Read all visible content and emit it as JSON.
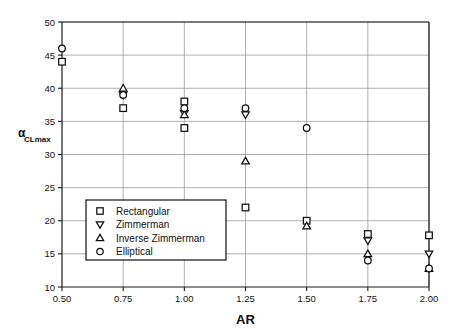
{
  "chart_data": {
    "type": "scatter",
    "title": "",
    "xlabel": "AR",
    "ylabel": "αCLmax",
    "ylabel_main": "α",
    "ylabel_sub": "CLmax",
    "xlim": [
      0.5,
      2.0
    ],
    "ylim": [
      10,
      50
    ],
    "xticks": [
      "0.50",
      "0.75",
      "1.00",
      "1.25",
      "1.50",
      "1.75",
      "2.00"
    ],
    "xtick_values": [
      0.5,
      0.75,
      1.0,
      1.25,
      1.5,
      1.75,
      2.0
    ],
    "yticks": [
      "10",
      "15",
      "20",
      "25",
      "30",
      "35",
      "40",
      "45",
      "50"
    ],
    "ytick_values": [
      10,
      15,
      20,
      25,
      30,
      35,
      40,
      45,
      50
    ],
    "grid": "horizontal-and-vertical",
    "legend_position": "lower-left-inside",
    "series": [
      {
        "name": "Rectangular",
        "marker": "square",
        "x": [
          0.5,
          0.75,
          1.0,
          1.25,
          1.5,
          1.75,
          2.0
        ],
        "values": [
          44.0,
          37.0,
          38.0,
          22.0,
          20.0,
          18.0,
          17.8
        ]
      },
      {
        "name": "Zimmerman",
        "marker": "triangle-down",
        "x": [
          0.75,
          1.0,
          1.25,
          1.75,
          2.0
        ],
        "values": [
          39.0,
          36.2,
          36.0,
          17.0,
          15.0
        ]
      },
      {
        "name": "Inverse Zimmerman",
        "marker": "triangle-up",
        "x": [
          0.75,
          1.0,
          1.25,
          1.5,
          1.75,
          2.0
        ],
        "values": [
          40.0,
          36.0,
          29.0,
          19.2,
          15.0,
          12.8
        ]
      },
      {
        "name": "Elliptical",
        "marker": "circle",
        "x": [
          0.5,
          0.75,
          1.0,
          1.25,
          1.5,
          1.75,
          2.0
        ],
        "values": [
          46.0,
          39.0,
          37.0,
          37.0,
          34.0,
          14.0,
          12.8
        ]
      },
      {
        "name": "Rectangular-extra",
        "marker": "square",
        "x": [
          1.0
        ],
        "values": [
          34.0
        ]
      }
    ],
    "legend": [
      {
        "label": "Rectangular",
        "marker": "square"
      },
      {
        "label": "Zimmerman",
        "marker": "triangle-down"
      },
      {
        "label": "Inverse Zimmerman",
        "marker": "triangle-up"
      },
      {
        "label": "Elliptical",
        "marker": "circle"
      }
    ],
    "colors": {
      "marker_stroke": "#101010",
      "marker_fill": "#ffffff",
      "grid": "#9a9a9a",
      "axis": "#1a1a1a",
      "background": "#ffffff"
    }
  }
}
